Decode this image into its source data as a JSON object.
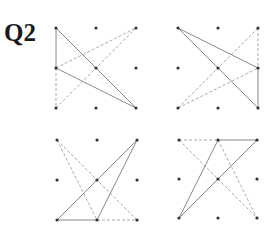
{
  "question": {
    "label": "Q2"
  },
  "style": {
    "dot_color": "#333333",
    "solid_color": "#888888",
    "dashed_color": "#aaaaaa"
  },
  "figures": [
    {
      "id": "top-left",
      "origin": [
        56,
        28
      ],
      "step": 40,
      "solid": [
        [
          [
            0,
            0
          ],
          [
            0,
            1
          ]
        ],
        [
          [
            0,
            0
          ],
          [
            2,
            2
          ]
        ],
        [
          [
            0,
            1
          ],
          [
            2,
            2
          ]
        ]
      ],
      "dashed": [
        [
          [
            0,
            1
          ],
          [
            2,
            0
          ]
        ],
        [
          [
            0,
            2
          ],
          [
            2,
            0
          ]
        ],
        [
          [
            0,
            1
          ],
          [
            0,
            2
          ]
        ]
      ]
    },
    {
      "id": "top-right",
      "origin": [
        178,
        28
      ],
      "step": 40,
      "solid": [
        [
          [
            0,
            0
          ],
          [
            2,
            1
          ]
        ],
        [
          [
            0,
            0
          ],
          [
            2,
            2
          ]
        ],
        [
          [
            2,
            1
          ],
          [
            2,
            2
          ]
        ]
      ],
      "dashed": [
        [
          [
            0,
            2
          ],
          [
            2,
            0
          ]
        ],
        [
          [
            0,
            2
          ],
          [
            2,
            1
          ]
        ],
        [
          [
            2,
            0
          ],
          [
            2,
            1
          ]
        ]
      ]
    },
    {
      "id": "bottom-left",
      "origin": [
        57,
        140
      ],
      "step": 40,
      "solid": [
        [
          [
            0,
            2
          ],
          [
            2,
            0
          ]
        ],
        [
          [
            1,
            2
          ],
          [
            2,
            0
          ]
        ],
        [
          [
            0,
            2
          ],
          [
            1,
            2
          ]
        ]
      ],
      "dashed": [
        [
          [
            0,
            0
          ],
          [
            2,
            2
          ]
        ],
        [
          [
            0,
            0
          ],
          [
            1,
            2
          ]
        ],
        [
          [
            1,
            2
          ],
          [
            2,
            2
          ]
        ]
      ]
    },
    {
      "id": "bottom-right",
      "origin": [
        179,
        140
      ],
      "step": 39,
      "solid": [
        [
          [
            0,
            2
          ],
          [
            1,
            0
          ]
        ],
        [
          [
            0,
            2
          ],
          [
            2,
            0
          ]
        ],
        [
          [
            1,
            0
          ],
          [
            2,
            0
          ]
        ]
      ],
      "dashed": [
        [
          [
            0,
            0
          ],
          [
            1,
            0
          ]
        ],
        [
          [
            0,
            0
          ],
          [
            2,
            2
          ]
        ],
        [
          [
            1,
            0
          ],
          [
            2,
            2
          ]
        ]
      ]
    }
  ]
}
